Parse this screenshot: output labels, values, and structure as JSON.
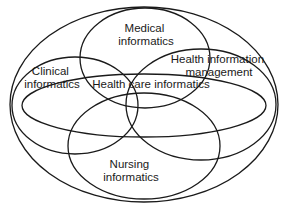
{
  "diagram": {
    "type": "venn-ellipse",
    "stroke_color": "#1a1a1a",
    "background": "#ffffff",
    "sets": {
      "outer": {
        "label": "",
        "ellipse": {
          "cx": 144,
          "cy": 104.5,
          "rx": 134,
          "ry": 97.5
        }
      },
      "medical": {
        "label_lines": [
          "Medical",
          "informatics"
        ],
        "ellipse": {
          "cx": 145,
          "cy": 58,
          "rx": 65,
          "ry": 50
        }
      },
      "clinical": {
        "label_lines": [
          "Clinical",
          "informatics"
        ],
        "ellipse": {
          "cx": 75,
          "cy": 105.5,
          "rx": 63,
          "ry": 48.5
        }
      },
      "him": {
        "label_lines": [
          "Health information",
          "management"
        ],
        "ellipse": {
          "cx": 201,
          "cy": 104.5,
          "rx": 75,
          "ry": 55.5
        }
      },
      "health_care": {
        "label_lines": [
          "Health care informatics"
        ],
        "ellipse": {
          "cx": 144,
          "cy": 105.5,
          "rx": 122,
          "ry": 31.5
        }
      },
      "nursing": {
        "label_lines": [
          "Nursing",
          "informatics"
        ],
        "ellipse": {
          "cx": 144,
          "cy": 146,
          "rx": 76,
          "ry": 53
        }
      }
    }
  }
}
